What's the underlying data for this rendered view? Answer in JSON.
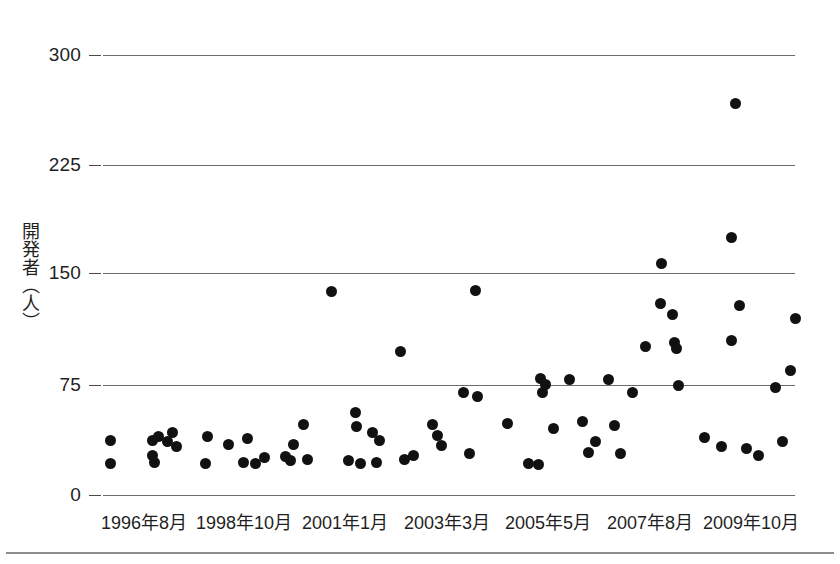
{
  "chart_data": {
    "type": "scatter",
    "title": "",
    "xlabel": "",
    "ylabel": "開発者（人）",
    "ylim": [
      0,
      300
    ],
    "yticks": [
      0,
      75,
      150,
      225,
      300
    ],
    "ytick_labels": [
      "0",
      "75",
      "150",
      "225",
      "300"
    ],
    "grid": true,
    "grid_axis": "y",
    "legend": "none",
    "marker": "filled-circle",
    "marker_color": "#111111",
    "xtick_labels": [
      "1996年8月",
      "1998年10月",
      "2001年1月",
      "2003年3月",
      "2005年5月",
      "2007年8月",
      "2009年10月"
    ],
    "x_axis_kind": "categorical-time",
    "x": [
      "1996-08",
      "1996-11",
      "1997-09",
      "1997-11",
      "1998-02",
      "1998-04",
      "1998-06",
      "1998-08",
      "1999-03",
      "1999-06",
      "1999-11",
      "2000-02",
      "2000-05",
      "2000-08",
      "2000-10",
      "2000-12",
      "2001-01",
      "2001-03",
      "2001-05",
      "2001-06",
      "2001-08",
      "2001-10",
      "2001-12",
      "2002-02",
      "2002-05",
      "2002-07",
      "2002-09",
      "2002-11",
      "2003-01",
      "2003-03",
      "2003-05",
      "2003-07",
      "2003-09",
      "2003-11",
      "2004-01",
      "2004-04",
      "2004-06",
      "2004-09",
      "2004-11",
      "2005-01",
      "2005-03",
      "2005-05",
      "2005-06",
      "2005-08",
      "2005-10",
      "2005-12",
      "2006-02",
      "2006-05",
      "2006-07",
      "2006-09",
      "2006-11",
      "2007-01",
      "2007-03",
      "2007-05",
      "2007-07",
      "2007-08",
      "2007-10",
      "2007-11",
      "2008-01",
      "2008-03",
      "2008-05",
      "2008-08",
      "2008-11",
      "2009-02",
      "2009-04",
      "2009-06",
      "2009-08",
      "2009-10",
      "2009-12"
    ],
    "y": [
      38,
      22,
      38,
      41,
      36,
      23,
      45,
      42,
      23,
      32,
      27,
      35,
      32,
      25,
      24,
      30,
      31,
      35,
      50,
      26,
      27,
      56,
      61,
      26,
      24,
      43,
      37,
      23,
      26,
      28,
      48,
      42,
      32,
      70,
      67,
      28,
      50,
      24,
      23,
      80,
      70,
      73,
      46,
      80,
      51,
      31,
      36,
      80,
      49,
      31,
      101,
      70,
      130,
      121,
      159,
      103,
      102,
      76,
      30,
      176,
      38,
      135,
      106,
      29,
      25,
      267,
      73,
      88,
      122
    ],
    "points": [
      {
        "px": 110,
        "py": 440,
        "value": 38
      },
      {
        "px": 110,
        "py": 463,
        "value": 22
      },
      {
        "px": 152,
        "py": 440,
        "value": 38
      },
      {
        "px": 158,
        "py": 436,
        "value": 41
      },
      {
        "px": 167,
        "py": 441,
        "value": 36
      },
      {
        "px": 154,
        "py": 462,
        "value": 23
      },
      {
        "px": 172,
        "py": 432,
        "value": 45
      },
      {
        "px": 176,
        "py": 446,
        "value": 42
      },
      {
        "px": 152,
        "py": 455,
        "value": 23
      },
      {
        "px": 207,
        "py": 436,
        "value": 32
      },
      {
        "px": 205,
        "py": 463,
        "value": 27
      },
      {
        "px": 228,
        "py": 444,
        "value": 35
      },
      {
        "px": 247,
        "py": 438,
        "value": 32
      },
      {
        "px": 243,
        "py": 462,
        "value": 25
      },
      {
        "px": 255,
        "py": 463,
        "value": 24
      },
      {
        "px": 264,
        "py": 457,
        "value": 30
      },
      {
        "px": 285,
        "py": 456,
        "value": 31
      },
      {
        "px": 293,
        "py": 444,
        "value": 35
      },
      {
        "px": 303,
        "py": 424,
        "value": 50
      },
      {
        "px": 290,
        "py": 460,
        "value": 26
      },
      {
        "px": 307,
        "py": 459,
        "value": 27
      },
      {
        "px": 331,
        "py": 291,
        "value": 139
      },
      {
        "px": 355,
        "py": 412,
        "value": 56
      },
      {
        "px": 356,
        "py": 426,
        "value": 61
      },
      {
        "px": 348,
        "py": 460,
        "value": 26
      },
      {
        "px": 360,
        "py": 463,
        "value": 24
      },
      {
        "px": 372,
        "py": 432,
        "value": 43
      },
      {
        "px": 379,
        "py": 440,
        "value": 37
      },
      {
        "px": 376,
        "py": 462,
        "value": 23
      },
      {
        "px": 400,
        "py": 351,
        "value": 98
      },
      {
        "px": 404,
        "py": 459,
        "value": 26
      },
      {
        "px": 413,
        "py": 455,
        "value": 28
      },
      {
        "px": 432,
        "py": 424,
        "value": 48
      },
      {
        "px": 437,
        "py": 435,
        "value": 42
      },
      {
        "px": 441,
        "py": 445,
        "value": 32
      },
      {
        "px": 463,
        "py": 392,
        "value": 70
      },
      {
        "px": 475,
        "py": 290,
        "value": 140
      },
      {
        "px": 477,
        "py": 396,
        "value": 67
      },
      {
        "px": 469,
        "py": 453,
        "value": 28
      },
      {
        "px": 507,
        "py": 423,
        "value": 50
      },
      {
        "px": 528,
        "py": 463,
        "value": 24
      },
      {
        "px": 538,
        "py": 464,
        "value": 23
      },
      {
        "px": 540,
        "py": 378,
        "value": 80
      },
      {
        "px": 542,
        "py": 392,
        "value": 70
      },
      {
        "px": 545,
        "py": 384,
        "value": 73
      },
      {
        "px": 553,
        "py": 428,
        "value": 46
      },
      {
        "px": 569,
        "py": 379,
        "value": 80
      },
      {
        "px": 582,
        "py": 421,
        "value": 51
      },
      {
        "px": 588,
        "py": 452,
        "value": 31
      },
      {
        "px": 595,
        "py": 441,
        "value": 36
      },
      {
        "px": 608,
        "py": 379,
        "value": 80
      },
      {
        "px": 614,
        "py": 425,
        "value": 49
      },
      {
        "px": 620,
        "py": 453,
        "value": 31
      },
      {
        "px": 632,
        "py": 392,
        "value": 70
      },
      {
        "px": 645,
        "py": 346,
        "value": 101
      },
      {
        "px": 661,
        "py": 263,
        "value": 159
      },
      {
        "px": 660,
        "py": 303,
        "value": 130
      },
      {
        "px": 672,
        "py": 314,
        "value": 121
      },
      {
        "px": 674,
        "py": 342,
        "value": 103
      },
      {
        "px": 676,
        "py": 348,
        "value": 102
      },
      {
        "px": 678,
        "py": 385,
        "value": 76
      },
      {
        "px": 704,
        "py": 437,
        "value": 38
      },
      {
        "px": 731,
        "py": 237,
        "value": 176
      },
      {
        "px": 739,
        "py": 305,
        "value": 130
      },
      {
        "px": 731,
        "py": 340,
        "value": 106
      },
      {
        "px": 735,
        "py": 103,
        "value": 267
      },
      {
        "px": 721,
        "py": 446,
        "value": 30
      },
      {
        "px": 746,
        "py": 448,
        "value": 29
      },
      {
        "px": 758,
        "py": 455,
        "value": 25
      },
      {
        "px": 775,
        "py": 387,
        "value": 73
      },
      {
        "px": 790,
        "py": 370,
        "value": 88
      },
      {
        "px": 782,
        "py": 441,
        "value": 36
      },
      {
        "px": 795,
        "py": 318,
        "value": 122
      }
    ]
  },
  "axes": {
    "plot_left": 103,
    "plot_right": 795,
    "y_pixels": {
      "0": 495,
      "75": 385,
      "150": 273,
      "225": 165,
      "300": 55
    },
    "ytick_labels": [
      "300",
      "225",
      "150",
      "75",
      "0"
    ],
    "ytick_y": [
      55,
      165,
      273,
      385,
      495
    ],
    "ylabel_text": "開発者（人）",
    "xticks": [
      {
        "label": "1996年8月",
        "px": 144
      },
      {
        "label": "1998年10月",
        "px": 244
      },
      {
        "label": "2001年1月",
        "px": 345
      },
      {
        "label": "2003年3月",
        "px": 447
      },
      {
        "label": "2005年5月",
        "px": 548
      },
      {
        "label": "2007年8月",
        "px": 650
      },
      {
        "label": "2009年10月",
        "px": 751
      }
    ]
  },
  "colors": {
    "marker": "#111111",
    "gridline": "#6b6b6b",
    "text": "#1f1f1f",
    "rule": "#8d8d8d",
    "background": "#ffffff"
  }
}
